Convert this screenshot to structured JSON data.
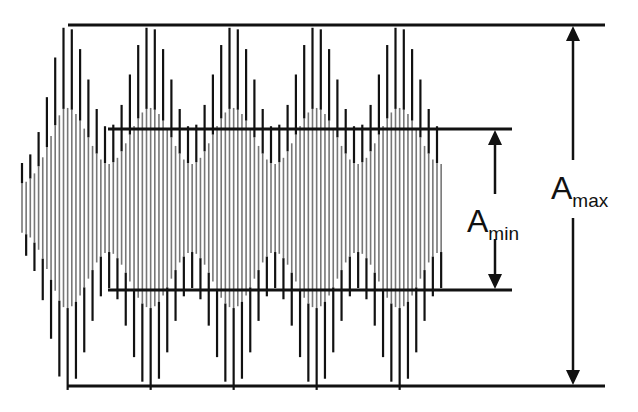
{
  "diagram": {
    "title": "",
    "type": "amplitude-modulated waveform (beat pattern) with envelope annotations",
    "colors": {
      "background": "#ffffff",
      "lines": "#111111",
      "wave_light": "#777777",
      "wave_dark": "#111111"
    },
    "labels": {
      "amax": {
        "main": "A",
        "sub": "max"
      },
      "amin": {
        "main": "A",
        "sub": "min"
      }
    },
    "waveform": {
      "x_start": 22,
      "x_end": 442,
      "center_y": 208,
      "carrier_period_px": 8.3,
      "envelope_period_px": 83,
      "first_envelope_peak_x": 67,
      "max_half_amplitude": 182,
      "min_half_amplitude": 80
    },
    "reference_lines": {
      "amax_top": {
        "y": 25,
        "x1": 68,
        "x2": 605
      },
      "amax_bottom": {
        "y": 386,
        "x1": 68,
        "x2": 605
      },
      "amin_top": {
        "y": 129,
        "x1": 108,
        "x2": 512
      },
      "amin_bottom": {
        "y": 290,
        "x1": 108,
        "x2": 512
      }
    },
    "arrows": {
      "amax": {
        "x": 573,
        "y_top": 25,
        "y_bottom": 386,
        "gap_top": 160,
        "gap_bottom": 218
      },
      "amin": {
        "x": 495,
        "y_top": 129,
        "y_bottom": 290,
        "gap_top": 194,
        "gap_bottom": 236
      }
    }
  }
}
